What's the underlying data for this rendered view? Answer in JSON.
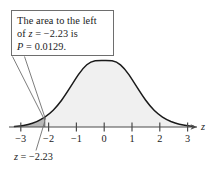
{
  "callout": {
    "lines": [
      "The area to the left",
      "of z = −2.23 is",
      "P = 0.0129."
    ]
  },
  "bottom_annotation": {
    "text": "z = −2.23"
  },
  "axis": {
    "name": "z",
    "tick_labels": [
      "−3",
      "−2",
      "−1",
      "0",
      "1",
      "2",
      "3"
    ]
  },
  "colors": {
    "curve": "#1a1a1a",
    "axis": "#4a4a4a",
    "body_fill": "#f0f0f0",
    "tail_fill": "#b8b8b8",
    "box_border": "#6e6e6e",
    "leader_line": "#6e6e6e",
    "text": "#1a1a1a"
  },
  "chart_data": {
    "type": "area",
    "title": "",
    "subtitle": "",
    "xlabel": "z",
    "ylabel": "",
    "distribution": "standard normal",
    "mean": 0,
    "sd": 1,
    "xlim": [
      -3.55,
      3.55
    ],
    "ylim": [
      0,
      0.4
    ],
    "xticks": [
      -3,
      -2,
      -1,
      0,
      1,
      2,
      3
    ],
    "xtick_labels": [
      "−3",
      "−2",
      "−1",
      "0",
      "1",
      "2",
      "3"
    ],
    "grid": false,
    "legend": null,
    "shaded_region": {
      "label": "left tail",
      "from": -3.55,
      "to": -2.23,
      "area": 0.0129,
      "fill": "#b8b8b8"
    },
    "unshaded_region": {
      "from": -2.23,
      "to": 3.55,
      "area": 0.9871,
      "fill": "#f0f0f0"
    },
    "annotations": [
      {
        "text": "The area to the left of z = −2.23 is P = 0.0129.",
        "points_to_z": -2.23
      },
      {
        "text": "z = −2.23",
        "points_to_z": -2.23
      }
    ],
    "critical_value": -2.23,
    "probability": 0.0129
  }
}
